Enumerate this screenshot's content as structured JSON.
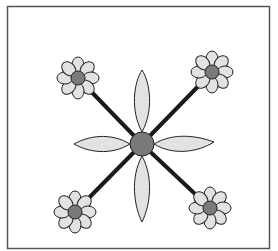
{
  "diagram": {
    "title": "",
    "colors": {
      "background": "#ffffff",
      "frame": "#555555",
      "stem": "#1a1a1a",
      "petal_fill": "#e2e2e2",
      "petal_stroke": "#222222",
      "center_fill": "#7a7a7a"
    },
    "center": {
      "x": 142,
      "y": 144,
      "radius": 12
    },
    "large_petals": 4,
    "flowers": [
      {
        "name": "top-left",
        "x": 78,
        "y": 78
      },
      {
        "name": "top-right",
        "x": 212,
        "y": 72
      },
      {
        "name": "bottom-left",
        "x": 75,
        "y": 212
      },
      {
        "name": "bottom-right",
        "x": 210,
        "y": 208
      }
    ]
  }
}
